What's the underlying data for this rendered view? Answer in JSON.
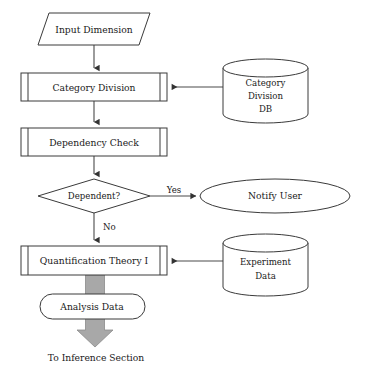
{
  "diagram": {
    "canvas": {
      "width": 367,
      "height": 376
    },
    "colors": {
      "background": "#ffffff",
      "stroke": "#3a3a3a",
      "connector": "#4a4a4a",
      "text": "#1a1a1a",
      "thick_arrow_fill": "#a8a8a8",
      "thick_arrow_stroke": "#8a8a8a"
    },
    "nodes": {
      "input_dimension": {
        "label": "Input Dimension",
        "shape": "parallelogram"
      },
      "category_division": {
        "label": "Category Division",
        "shape": "predefined-process"
      },
      "category_division_db": {
        "label_line1": "Category",
        "label_line2": "Division",
        "label_line3": "DB",
        "shape": "cylinder"
      },
      "dependency_check": {
        "label": "Dependency Check",
        "shape": "predefined-process"
      },
      "dependent_decision": {
        "label": "Dependent?",
        "shape": "diamond"
      },
      "notify_user": {
        "label": "Notify User",
        "shape": "ellipse"
      },
      "quantification_theory": {
        "label": "Quantification Theory I",
        "shape": "predefined-process"
      },
      "experiment_data_db": {
        "label_line1": "Experiment",
        "label_line2": "Data",
        "shape": "cylinder"
      },
      "analysis_data": {
        "label": "Analysis Data",
        "shape": "rounded-rectangle"
      },
      "to_inference_section": {
        "label": "To Inference Section",
        "shape": "text"
      }
    },
    "edges": {
      "yes_branch": {
        "label": "Yes"
      },
      "no_branch": {
        "label": "No"
      }
    }
  }
}
